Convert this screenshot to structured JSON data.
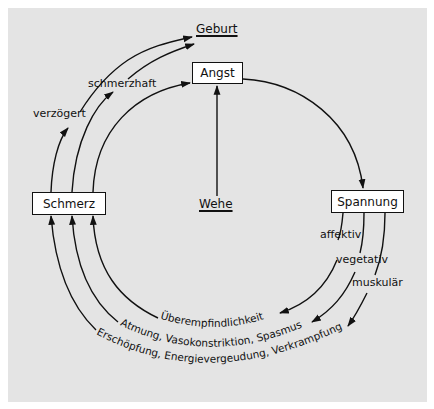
{
  "diagram": {
    "nodes": {
      "angst": "Angst",
      "spannung": "Spannung",
      "schmerz": "Schmerz"
    },
    "labels": {
      "geburt": "Geburt",
      "wehe": "Wehe",
      "verzoegert": "verzögert",
      "schmerzhaft": "schmerzhaft",
      "affektiv": "affektiv",
      "vegetativ": "vegetativ",
      "muskular": "muskulär"
    },
    "arc_labels": {
      "inner": "Überempfindlichkeit",
      "middle": "Atmung, Vasokonstriktion, Spasmus",
      "outer": "Erschöpfung, Energievergeudung, Verkrampfung"
    },
    "edges": [
      {
        "from": "Wehe",
        "to": "Angst"
      },
      {
        "from": "Angst",
        "to": "Spannung"
      },
      {
        "from": "Spannung",
        "to": "Überempfindlichkeit",
        "label": "affektiv"
      },
      {
        "from": "Spannung",
        "to": "Atmung, Vasokonstriktion, Spasmus",
        "label": "vegetativ"
      },
      {
        "from": "Spannung",
        "to": "Erschöpfung, Energievergeudung, Verkrampfung",
        "label": "muskulär"
      },
      {
        "from": "Überempfindlichkeit",
        "to": "Schmerz"
      },
      {
        "from": "Atmung, Vasokonstriktion, Spasmus",
        "to": "Schmerz"
      },
      {
        "from": "Erschöpfung, Energievergeudung, Verkrampfung",
        "to": "Schmerz"
      },
      {
        "from": "Schmerz",
        "to": "Angst"
      },
      {
        "from": "Schmerz",
        "to": "Geburt",
        "label": "schmerzhaft"
      },
      {
        "from": "Schmerz",
        "to": "Geburt",
        "label": "verzögert"
      }
    ],
    "colors": {
      "panel_background": "#e4e4e4",
      "line": "#111111",
      "box_fill": "#ffffff"
    }
  }
}
